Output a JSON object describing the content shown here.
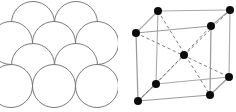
{
  "figure": {
    "width": 236,
    "height": 112,
    "background_color": "#ffffff"
  },
  "panels": [
    {
      "id": "sphere-packing",
      "name": "hard-sphere-packing-model",
      "caption": "",
      "outline_color": "#6b6b6b",
      "fill_color": "#ffffff",
      "sphere_radius": 21.5,
      "stroke_width": 0.9,
      "spheres": [
        {
          "label": "top-row-left",
          "cx": 33,
          "cy": 23
        },
        {
          "label": "top-row-right",
          "cx": 76,
          "cy": 23
        },
        {
          "label": "mid-row-left",
          "cx": 11,
          "cy": 43
        },
        {
          "label": "mid-row-center",
          "cx": 54,
          "cy": 43
        },
        {
          "label": "mid-row-right",
          "cx": 97,
          "cy": 43
        },
        {
          "label": "low-row-left",
          "cx": 33,
          "cy": 65
        },
        {
          "label": "low-row-right",
          "cx": 76,
          "cy": 65
        },
        {
          "label": "bottom-row-left",
          "cx": 11,
          "cy": 86
        },
        {
          "label": "bottom-row-right",
          "cx": 54,
          "cy": 86
        },
        {
          "label": "bottom-row-far",
          "cx": 97,
          "cy": 86
        }
      ]
    },
    {
      "id": "unit-cell",
      "name": "ball-and-stick-unit-cell",
      "caption": "",
      "atom_color": "#0b0b0b",
      "atom_radius": 4.0,
      "edge_color_front": "#9a9a9a",
      "edge_color_back": "#a8a8a8",
      "diagonal_color": "#6f6f6f",
      "diagonal_style": "dashed",
      "atoms": [
        {
          "label": "corner-front-bottom-left",
          "cx": 20,
          "cy": 101,
          "kind": "corner"
        },
        {
          "label": "corner-front-bottom-right",
          "cx": 92,
          "cy": 95,
          "kind": "corner"
        },
        {
          "label": "corner-front-top-left",
          "cx": 18,
          "cy": 33,
          "kind": "corner"
        },
        {
          "label": "corner-front-top-right",
          "cx": 93,
          "cy": 26,
          "kind": "corner"
        },
        {
          "label": "corner-back-bottom-left",
          "cx": 38,
          "cy": 84,
          "kind": "corner"
        },
        {
          "label": "corner-back-bottom-right",
          "cx": 111,
          "cy": 77,
          "kind": "corner"
        },
        {
          "label": "corner-back-top-left",
          "cx": 40,
          "cy": 11,
          "kind": "corner"
        },
        {
          "label": "corner-back-top-right",
          "cx": 112,
          "cy": 10,
          "kind": "corner"
        },
        {
          "label": "body-center-atom",
          "cx": 66,
          "cy": 55,
          "kind": "center"
        }
      ],
      "edges": [
        {
          "label": "front-bottom",
          "x1": 20,
          "y1": 101,
          "x2": 92,
          "y2": 95,
          "depth": "front"
        },
        {
          "label": "front-left",
          "x1": 20,
          "y1": 101,
          "x2": 18,
          "y2": 33,
          "depth": "front"
        },
        {
          "label": "front-right",
          "x1": 92,
          "y1": 95,
          "x2": 93,
          "y2": 26,
          "depth": "front"
        },
        {
          "label": "front-top",
          "x1": 18,
          "y1": 33,
          "x2": 93,
          "y2": 26,
          "depth": "front"
        },
        {
          "label": "back-bottom",
          "x1": 38,
          "y1": 84,
          "x2": 111,
          "y2": 77,
          "depth": "back"
        },
        {
          "label": "back-left",
          "x1": 38,
          "y1": 84,
          "x2": 40,
          "y2": 11,
          "depth": "back"
        },
        {
          "label": "back-right",
          "x1": 111,
          "y1": 77,
          "x2": 112,
          "y2": 10,
          "depth": "back"
        },
        {
          "label": "back-top",
          "x1": 40,
          "y1": 11,
          "x2": 112,
          "y2": 10,
          "depth": "back"
        },
        {
          "label": "connect-top-left",
          "x1": 18,
          "y1": 33,
          "x2": 40,
          "y2": 11,
          "depth": "back"
        },
        {
          "label": "connect-top-right",
          "x1": 93,
          "y1": 26,
          "x2": 112,
          "y2": 10,
          "depth": "back"
        },
        {
          "label": "connect-bottom-left",
          "x1": 20,
          "y1": 101,
          "x2": 38,
          "y2": 84,
          "depth": "back"
        },
        {
          "label": "connect-bottom-right",
          "x1": 92,
          "y1": 95,
          "x2": 111,
          "y2": 77,
          "depth": "front"
        }
      ],
      "diagonals": [
        {
          "label": "diagonal-back-top-left-to-front-bottom-right",
          "x1": 40,
          "y1": 11,
          "x2": 92,
          "y2": 95
        },
        {
          "label": "diagonal-front-top-left-to-back-bottom-right",
          "x1": 18,
          "y1": 33,
          "x2": 111,
          "y2": 77
        },
        {
          "label": "diagonal-back-bottom-left-to-front-top-right",
          "x1": 38,
          "y1": 84,
          "x2": 93,
          "y2": 26
        },
        {
          "label": "diagonal-front-bottom-left-to-back-top-right",
          "x1": 20,
          "y1": 101,
          "x2": 112,
          "y2": 10
        }
      ]
    }
  ]
}
